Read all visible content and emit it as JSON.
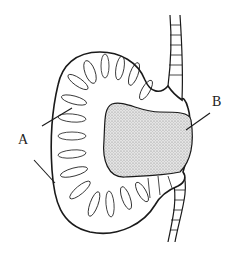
{
  "diagram": {
    "type": "biological-cross-section",
    "labels": [
      {
        "id": "A",
        "text": "A",
        "pointers": 2
      },
      {
        "id": "B",
        "text": "B",
        "pointers": 1
      }
    ],
    "colors": {
      "line": "#1a1a1a",
      "lumen_fill": "#d9d9d9",
      "background": "#ffffff"
    }
  }
}
